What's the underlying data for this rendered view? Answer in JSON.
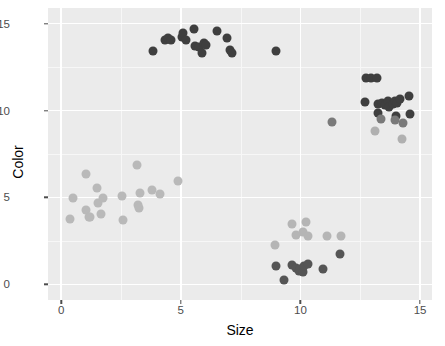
{
  "chart_data": {
    "type": "scatter",
    "title": "",
    "subtitle": "",
    "xlabel": "Size",
    "ylabel": "Color",
    "xlim": [
      -0.55,
      15.5
    ],
    "ylim": [
      -0.9,
      15.9
    ],
    "x_ticks": [
      0,
      5,
      10,
      15
    ],
    "x_tick_labels": [
      "0",
      "5",
      "10",
      "15"
    ],
    "y_ticks": [
      0,
      5,
      10,
      15
    ],
    "y_tick_labels": [
      "0",
      "5",
      "10",
      "15"
    ],
    "grid": true,
    "grid_major_color": "#ffffff",
    "grid_minor_color": "#f7f7f7",
    "panel_background": "#ebebeb",
    "legend": "none",
    "point_size_px": 9,
    "series": [
      {
        "name": "cluster-top-dark",
        "color": "#3f3f3f",
        "points": [
          [
            3.85,
            13.4
          ],
          [
            4.35,
            14.05
          ],
          [
            4.45,
            14.2
          ],
          [
            4.6,
            14.05
          ],
          [
            5.05,
            14.25
          ],
          [
            5.1,
            14.45
          ],
          [
            5.2,
            14.05
          ],
          [
            5.55,
            14.7
          ],
          [
            5.6,
            13.7
          ],
          [
            5.75,
            13.65
          ],
          [
            5.9,
            13.3
          ],
          [
            5.95,
            13.9
          ],
          [
            6.05,
            13.75
          ],
          [
            6.5,
            14.6
          ],
          [
            6.95,
            14.15
          ],
          [
            7.05,
            13.5
          ],
          [
            7.15,
            13.3
          ],
          [
            9.0,
            13.4
          ]
        ]
      },
      {
        "name": "cluster-right-dark",
        "color": "#3f3f3f",
        "points": [
          [
            12.75,
            11.85
          ],
          [
            12.95,
            11.85
          ],
          [
            13.2,
            11.9
          ],
          [
            12.7,
            10.5
          ],
          [
            13.25,
            10.35
          ],
          [
            13.4,
            10.45
          ],
          [
            13.55,
            10.3
          ],
          [
            13.65,
            10.55
          ],
          [
            13.7,
            10.2
          ],
          [
            13.85,
            10.4
          ],
          [
            13.95,
            10.55
          ],
          [
            14.05,
            10.45
          ],
          [
            14.15,
            10.65
          ],
          [
            14.55,
            10.85
          ],
          [
            13.25,
            9.85
          ],
          [
            14.0,
            9.7
          ],
          [
            14.6,
            9.8
          ]
        ]
      },
      {
        "name": "cluster-right-mid",
        "color": "#7a7a7a",
        "points": [
          [
            13.35,
            9.5
          ],
          [
            13.95,
            9.45
          ],
          [
            14.3,
            9.3
          ],
          [
            11.3,
            9.35
          ]
        ]
      },
      {
        "name": "cluster-right-light",
        "color": "#b0b0b0",
        "points": [
          [
            13.1,
            8.8
          ],
          [
            14.25,
            8.35
          ]
        ]
      },
      {
        "name": "cluster-bottom-dark",
        "color": "#555555",
        "points": [
          [
            9.0,
            1.05
          ],
          [
            9.3,
            0.25
          ],
          [
            9.65,
            1.1
          ],
          [
            9.8,
            0.95
          ],
          [
            9.95,
            0.75
          ],
          [
            10.0,
            0.9
          ],
          [
            10.1,
            0.7
          ],
          [
            10.15,
            1.05
          ],
          [
            10.3,
            1.15
          ],
          [
            10.95,
            0.9
          ],
          [
            11.65,
            1.75
          ]
        ]
      },
      {
        "name": "cluster-bottom-light",
        "color": "#b5b5b5",
        "points": [
          [
            9.65,
            3.45
          ],
          [
            10.25,
            3.6
          ],
          [
            9.8,
            2.85
          ],
          [
            10.1,
            3.0
          ],
          [
            10.3,
            2.8
          ],
          [
            8.95,
            2.25
          ],
          [
            11.1,
            2.8
          ],
          [
            11.7,
            2.8
          ]
        ]
      },
      {
        "name": "cluster-lower-left",
        "color": "#b9b9b9",
        "points": [
          [
            0.35,
            3.75
          ],
          [
            0.5,
            4.95
          ],
          [
            1.05,
            6.35
          ],
          [
            1.05,
            4.25
          ],
          [
            1.15,
            3.85
          ],
          [
            1.2,
            3.9
          ],
          [
            1.5,
            5.55
          ],
          [
            1.55,
            4.7
          ],
          [
            1.65,
            4.05
          ],
          [
            1.75,
            4.95
          ],
          [
            2.55,
            5.1
          ],
          [
            2.6,
            3.7
          ],
          [
            3.15,
            6.85
          ],
          [
            3.2,
            4.55
          ],
          [
            3.25,
            4.4
          ],
          [
            3.3,
            5.25
          ],
          [
            3.8,
            5.45
          ],
          [
            4.15,
            5.2
          ],
          [
            4.9,
            5.95
          ]
        ]
      }
    ]
  },
  "axes": {
    "x_title": "Size",
    "y_title": "Color"
  }
}
